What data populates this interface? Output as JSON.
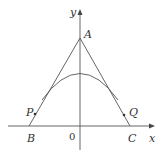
{
  "diagram": {
    "axes": {
      "x_label": "x",
      "y_label": "y",
      "origin_label": "0"
    },
    "points": {
      "A": "A",
      "B": "B",
      "C": "C",
      "P": "P",
      "Q": "Q"
    },
    "colors": {
      "line": "#555555",
      "text": "#333333",
      "background": "#ffffff"
    }
  }
}
